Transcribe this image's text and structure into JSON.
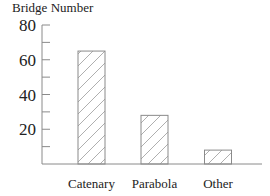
{
  "chart_data": {
    "type": "bar",
    "title": "",
    "ylabel": "Bridge Number",
    "xlabel": "",
    "categories": [
      "Catenary",
      "Parabola",
      "Other"
    ],
    "values": [
      65,
      28,
      8
    ],
    "ylim": [
      0,
      80
    ],
    "yticks": [
      20,
      40,
      60,
      80
    ],
    "yminor_ticks": [
      10,
      30,
      50,
      70
    ],
    "grid": false,
    "legend": null,
    "bar_style": {
      "fill": "hatched",
      "hatch": "diagonal",
      "stroke": "#8a8a8a",
      "hatch_color": "#9a9a9a"
    }
  },
  "labels": {
    "y_title": "Bridge Number"
  }
}
